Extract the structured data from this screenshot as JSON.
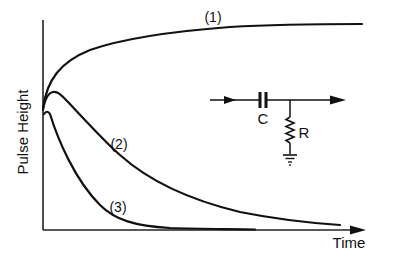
{
  "figure": {
    "title": "",
    "axes": {
      "ylabel": "Pulse Height",
      "xlabel": "Time"
    },
    "curves": [
      {
        "id": "1",
        "label": "(1)",
        "behavior": "rises quickly then saturates"
      },
      {
        "id": "2",
        "label": "(2)",
        "behavior": "rises briefly then decays slowly"
      },
      {
        "id": "3",
        "label": "(3)",
        "behavior": "decays rapidly to zero"
      }
    ],
    "circuit": {
      "capacitor_label": "C",
      "resistor_label": "R",
      "description": "series capacitor with shunt resistor to ground (CR differentiator)"
    },
    "colors": {
      "ink": "#111111",
      "background": "#ffffff"
    }
  }
}
